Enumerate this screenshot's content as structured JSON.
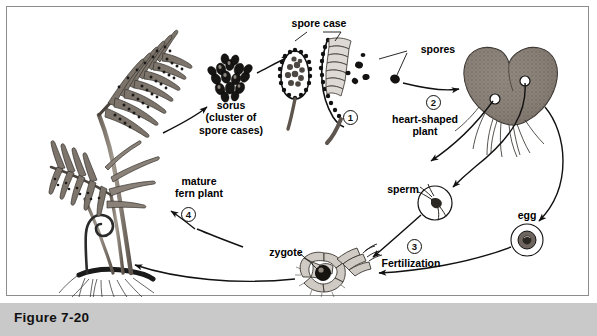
{
  "figure": {
    "caption": "Figure 7-20"
  },
  "diagram": {
    "border_color": "#8d8d8d",
    "caption_bar_color": "#c9c9c9",
    "ink_color": "#111111"
  },
  "labels": {
    "sorus": "sorus\n(cluster of\nspore cases)",
    "spore_case": "spore case",
    "spores": "spores",
    "heart_shaped_plant": "heart-shaped\nplant",
    "sperm": "sperm",
    "egg": "egg",
    "zygote": "zygote",
    "fertilization": "Fertilization",
    "female_structure": "female structure",
    "mature_fern_plant": "mature\nfern plant"
  },
  "stages": [
    {
      "number": "1",
      "name": "spore-case-release"
    },
    {
      "number": "2",
      "name": "heart-shaped-gametophyte"
    },
    {
      "number": "3",
      "name": "fertilization"
    },
    {
      "number": "4",
      "name": "mature-sporophyte"
    }
  ]
}
